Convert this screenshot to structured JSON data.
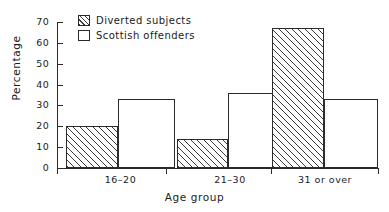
{
  "chart_data": {
    "type": "bar",
    "title": "",
    "xlabel": "Age group",
    "ylabel": "Percentage",
    "categories": [
      "16–20",
      "21–30",
      "31 or over"
    ],
    "series": [
      {
        "name": "Diverted subjects",
        "values": [
          20,
          14,
          67
        ],
        "style": "hatched"
      },
      {
        "name": "Scottish offenders",
        "values": [
          33,
          36,
          33
        ],
        "style": "open"
      }
    ],
    "ylim": [
      0,
      70
    ],
    "yticks": [
      0,
      10,
      20,
      30,
      40,
      50,
      60,
      70
    ],
    "ytick_labels": [
      "0",
      "10",
      "20",
      "30",
      "40",
      "50",
      "60",
      "70"
    ],
    "grid": false,
    "legend_position": "top-left-inside",
    "colors": {
      "line": "#2b2b2b",
      "hatch": "#3a3a3a",
      "background": "#ffffff"
    }
  },
  "legend": {
    "entries": [
      {
        "label": "Diverted subjects"
      },
      {
        "label": "Scottish offenders"
      }
    ]
  },
  "axes": {
    "y_title": "Percentage",
    "x_title": "Age group"
  }
}
